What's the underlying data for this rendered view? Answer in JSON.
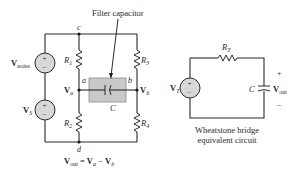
{
  "figure": {
    "bridge_circuit": {
      "annotation": "Filter capacitor",
      "nodes": {
        "top": "c",
        "left": "a",
        "right": "b",
        "bottom": "d"
      },
      "sources": [
        {
          "name": "V",
          "subscript": "noise"
        },
        {
          "name": "V",
          "subscript": "S"
        }
      ],
      "resistors": [
        {
          "name": "R",
          "subscript": "1"
        },
        {
          "name": "R",
          "subscript": "2"
        },
        {
          "name": "R",
          "subscript": "3"
        },
        {
          "name": "R",
          "subscript": "4"
        }
      ],
      "capacitor": "C",
      "node_voltages": [
        {
          "name": "V",
          "subscript": "a"
        },
        {
          "name": "V",
          "subscript": "b"
        }
      ],
      "equation": {
        "lhs": "V",
        "lhs_sub": "out",
        "eq": " = ",
        "t1": "V",
        "t1_sub": "a",
        "minus": " − ",
        "t2": "V",
        "t2_sub": "b"
      }
    },
    "equivalent_circuit": {
      "source": {
        "name": "V",
        "subscript": "T"
      },
      "resistor": {
        "name": "R",
        "subscript": "T"
      },
      "capacitor": "C",
      "output": {
        "name": "V",
        "subscript": "out"
      },
      "plus": "+",
      "minus": "−",
      "caption_line1": "Wheatstone bridge",
      "caption_line2": "equivalent circuit"
    },
    "source_symbols": {
      "plus": "+",
      "minus": "−"
    }
  }
}
